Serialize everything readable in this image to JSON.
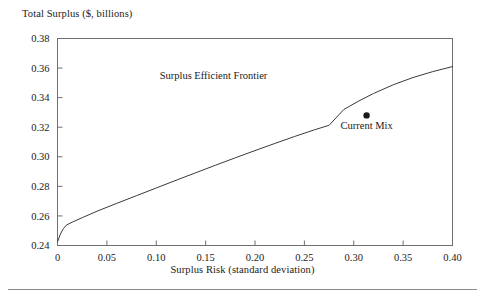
{
  "chart_data": {
    "type": "line",
    "title": "",
    "xlabel": "Surplus Risk (standard deviation)",
    "ylabel": "Total Surplus ($, billions)",
    "xlim": [
      0,
      0.4
    ],
    "ylim": [
      0.24,
      0.38
    ],
    "xticks": [
      0,
      0.05,
      0.1,
      0.15,
      0.2,
      0.25,
      0.3,
      0.35,
      0.4
    ],
    "xtick_labels": [
      "0",
      "0.05",
      "0.10",
      "0.15",
      "0.20",
      "0.25",
      "0.30",
      "0.35",
      "0.40"
    ],
    "yticks": [
      0.24,
      0.26,
      0.28,
      0.3,
      0.32,
      0.34,
      0.36,
      0.38
    ],
    "ytick_labels": [
      "0.24",
      "0.26",
      "0.28",
      "0.30",
      "0.32",
      "0.34",
      "0.36",
      "0.38"
    ],
    "grid": false,
    "legend_position": "none",
    "series": [
      {
        "name": "Surplus Efficient Frontier",
        "type": "line",
        "color": "#3a3a3a",
        "x": [
          0.0,
          0.003,
          0.006,
          0.009,
          0.015,
          0.025,
          0.04,
          0.06,
          0.08,
          0.1,
          0.12,
          0.14,
          0.16,
          0.18,
          0.2,
          0.22,
          0.24,
          0.26,
          0.275,
          0.29,
          0.305,
          0.32,
          0.34,
          0.36,
          0.38,
          0.4
        ],
        "y": [
          0.2425,
          0.2478,
          0.2515,
          0.2538,
          0.2558,
          0.2588,
          0.2632,
          0.2685,
          0.2737,
          0.2789,
          0.2841,
          0.2892,
          0.2943,
          0.2993,
          0.3042,
          0.309,
          0.3137,
          0.3182,
          0.3213,
          0.332,
          0.3377,
          0.3428,
          0.3487,
          0.3536,
          0.3576,
          0.361
        ]
      },
      {
        "name": "Current Mix",
        "type": "scatter",
        "color": "#1a1a1a",
        "x": [
          0.313
        ],
        "y": [
          0.328
        ]
      }
    ],
    "annotations": [
      {
        "text": "Surplus Efficient Frontier",
        "x": 0.158,
        "y": 0.3528
      },
      {
        "text": "Current Mix",
        "x": 0.313,
        "y": 0.3185
      }
    ]
  }
}
